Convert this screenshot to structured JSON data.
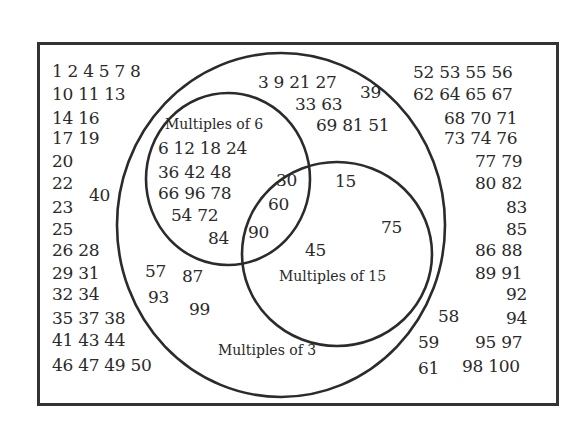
{
  "diagram": {
    "type": "venn",
    "universe": "Numbers 1 to 100",
    "sets": {
      "multiples_of_3": {
        "label": "Multiples of 3"
      },
      "multiples_of_6": {
        "label": "Multiples of 6"
      },
      "multiples_of_15": {
        "label": "Multiples of 15"
      }
    },
    "regions": {
      "outside": {
        "rows": [
          {
            "x": 52,
            "y": 71,
            "text": "1 2 4 5 7 8"
          },
          {
            "x": 52,
            "y": 94,
            "text": "10 11 13"
          },
          {
            "x": 52,
            "y": 118,
            "text": "14 16"
          },
          {
            "x": 52,
            "y": 138,
            "text": "17 19"
          },
          {
            "x": 52,
            "y": 161,
            "text": "20"
          },
          {
            "x": 52,
            "y": 183,
            "text": "22"
          },
          {
            "x": 89,
            "y": 195,
            "text": "40"
          },
          {
            "x": 52,
            "y": 207,
            "text": "23"
          },
          {
            "x": 52,
            "y": 229,
            "text": "25"
          },
          {
            "x": 52,
            "y": 250,
            "text": "26 28"
          },
          {
            "x": 52,
            "y": 273,
            "text": "29 31"
          },
          {
            "x": 52,
            "y": 294,
            "text": "32 34"
          },
          {
            "x": 52,
            "y": 318,
            "text": "35 37 38"
          },
          {
            "x": 52,
            "y": 340,
            "text": "41 43 44"
          },
          {
            "x": 52,
            "y": 365,
            "text": "46 47 49 50"
          },
          {
            "x": 413,
            "y": 72,
            "text": "52 53 55 56"
          },
          {
            "x": 413,
            "y": 94,
            "text": "62 64 65 67"
          },
          {
            "x": 444,
            "y": 118,
            "text": "68 70 71"
          },
          {
            "x": 444,
            "y": 138,
            "text": "73 74 76"
          },
          {
            "x": 475,
            "y": 161,
            "text": "77 79"
          },
          {
            "x": 475,
            "y": 183,
            "text": "80 82"
          },
          {
            "x": 506,
            "y": 207,
            "text": "83"
          },
          {
            "x": 506,
            "y": 229,
            "text": "85"
          },
          {
            "x": 475,
            "y": 250,
            "text": "86 88"
          },
          {
            "x": 475,
            "y": 273,
            "text": "89 91"
          },
          {
            "x": 506,
            "y": 294,
            "text": "92"
          },
          {
            "x": 438,
            "y": 316,
            "text": "58"
          },
          {
            "x": 506,
            "y": 318,
            "text": "94"
          },
          {
            "x": 418,
            "y": 342,
            "text": "59"
          },
          {
            "x": 475,
            "y": 342,
            "text": "95 97"
          },
          {
            "x": 418,
            "y": 368,
            "text": "61"
          },
          {
            "x": 462,
            "y": 366,
            "text": "98 100"
          }
        ]
      },
      "multiples_of_3_only": {
        "rows": [
          {
            "x": 258,
            "y": 82,
            "text": "3 9 21 27"
          },
          {
            "x": 360,
            "y": 92,
            "text": "39"
          },
          {
            "x": 295,
            "y": 104,
            "text": "33 63"
          },
          {
            "x": 316,
            "y": 125,
            "text": "69 81 51"
          },
          {
            "x": 145,
            "y": 271,
            "text": "57"
          },
          {
            "x": 182,
            "y": 276,
            "text": "87"
          },
          {
            "x": 148,
            "y": 297,
            "text": "93"
          },
          {
            "x": 189,
            "y": 309,
            "text": "99"
          }
        ]
      },
      "multiples_of_6_only": {
        "rows": [
          {
            "x": 158,
            "y": 148,
            "text": "6 12 18 24"
          },
          {
            "x": 158,
            "y": 172,
            "text": "36 42 48"
          },
          {
            "x": 158,
            "y": 193,
            "text": "66 96 78"
          },
          {
            "x": 171,
            "y": 215,
            "text": "54 72"
          },
          {
            "x": 208,
            "y": 238,
            "text": "84"
          }
        ]
      },
      "multiples_of_6_and_15": {
        "rows": [
          {
            "x": 276,
            "y": 180,
            "text": "30"
          },
          {
            "x": 268,
            "y": 204,
            "text": "60"
          },
          {
            "x": 248,
            "y": 232,
            "text": "90"
          }
        ]
      },
      "multiples_of_15_only": {
        "rows": [
          {
            "x": 335,
            "y": 181,
            "text": "15"
          },
          {
            "x": 381,
            "y": 227,
            "text": "75"
          },
          {
            "x": 305,
            "y": 250,
            "text": "45"
          }
        ]
      }
    },
    "labels": [
      {
        "x": 165,
        "y": 124,
        "text": "Multiples of 6"
      },
      {
        "x": 279,
        "y": 276,
        "text": "Multiples of 15"
      },
      {
        "x": 218,
        "y": 350,
        "text": "Multiples of 3"
      }
    ],
    "colors": {
      "stroke": "#2b2b2b",
      "text": "#2a2a2a",
      "background": "#ffffff"
    }
  }
}
